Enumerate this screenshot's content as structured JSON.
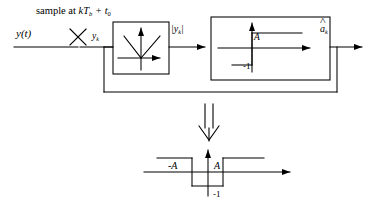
{
  "figure": {
    "stroke_color": "#000000",
    "background_color": "#ffffff"
  },
  "annotations": {
    "sample_note_prefix": "sample at",
    "sample_note_symbol": "kT",
    "sample_note_symbol_sub": "b",
    "sample_note_plus": "+ t",
    "sample_note_plus_sub": "0",
    "sample_note_full": "sample at kTb + t0"
  },
  "signals": {
    "input": "y(t)",
    "sampled": "y",
    "sampled_sub": "k",
    "rectified_open": "|y",
    "rectified_sub": "k",
    "rectified_close": "|",
    "output": "a",
    "output_sub": "k",
    "output_full": "âk"
  },
  "blocks": [
    {
      "id": "rectifier",
      "name": "absolute-value-block",
      "function": "|y|",
      "description": "V-shaped absolute value transfer characteristic with x and y axes"
    },
    {
      "id": "threshold",
      "name": "threshold-detector-block",
      "function": "step threshold at A",
      "description": "Step transfer characteristic: output -1 below threshold A, +1 above",
      "threshold_label": "A",
      "low_level_label": "-1"
    }
  ],
  "feedback": {
    "name": "feedback-path",
    "description": "Feedback line from threshold block output back to rectifier block input"
  },
  "implication": {
    "glyph": "double-down-arrow",
    "meaning": "results in equivalent characteristic"
  },
  "equivalent_plot": {
    "name": "combined-transfer-characteristic",
    "negative_threshold_label": "-A",
    "positive_threshold_label": "A",
    "low_level_label": "-1",
    "description": "Combined characteristic: output is -1 for -A < x < A and +1 outside"
  }
}
